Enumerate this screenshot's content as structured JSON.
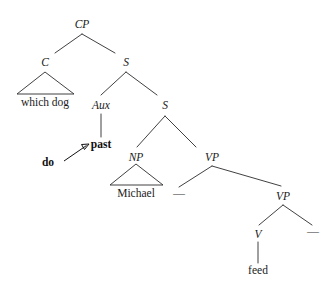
{
  "figure": {
    "kind": "syntax-tree",
    "sentence": "which dog do past Michael feed",
    "background_color": "#ffffff",
    "line_color": "#2b2b2b",
    "text_color": "#1a1a1a"
  },
  "nodes": {
    "cp": {
      "label": "CP",
      "x": 82,
      "y": 24,
      "style": "italic"
    },
    "c": {
      "label": "C",
      "x": 45,
      "y": 62,
      "style": "italic"
    },
    "s_top": {
      "label": "S",
      "x": 126,
      "y": 62,
      "style": "italic"
    },
    "aux": {
      "label": "Aux",
      "x": 101,
      "y": 105,
      "style": "italic"
    },
    "s_lower": {
      "label": "S",
      "x": 165,
      "y": 105,
      "style": "italic"
    },
    "np": {
      "label": "NP",
      "x": 136,
      "y": 157,
      "style": "italic"
    },
    "vp_upper": {
      "label": "VP",
      "x": 212,
      "y": 157,
      "style": "italic"
    },
    "vp_lower": {
      "label": "VP",
      "x": 283,
      "y": 196,
      "style": "italic"
    },
    "v": {
      "label": "V",
      "x": 258,
      "y": 234,
      "style": "italic"
    }
  },
  "terminals": {
    "which_dog": {
      "label": "which dog",
      "x": 45,
      "y": 106
    },
    "past": {
      "label": "past",
      "x": 101,
      "y": 148,
      "bold": true
    },
    "do": {
      "label": "do",
      "x": 48,
      "y": 166,
      "bold": true
    },
    "michael": {
      "label": "Michael",
      "x": 136,
      "y": 197
    },
    "feed": {
      "label": "feed",
      "x": 258,
      "y": 274
    }
  },
  "traces": {
    "trace_subject_gap": {
      "label": "—",
      "x": 179,
      "y": 196
    },
    "trace_object_gap": {
      "label": "—",
      "x": 313,
      "y": 234
    }
  },
  "triangles": {
    "c_triangle": {
      "apex_x": 45,
      "apex_y": 72,
      "left_x": 17,
      "right_x": 74,
      "base_y": 94
    },
    "np_triangle": {
      "apex_x": 136,
      "apex_y": 164,
      "left_x": 110,
      "right_x": 163,
      "base_y": 185
    }
  },
  "branches": [
    {
      "name": "cp-to-c",
      "x1": 82,
      "y1": 34,
      "x2": 55,
      "y2": 53
    },
    {
      "name": "cp-to-s",
      "x1": 82,
      "y1": 34,
      "x2": 115,
      "y2": 53
    },
    {
      "name": "s-to-aux",
      "x1": 126,
      "y1": 72,
      "x2": 101,
      "y2": 95
    },
    {
      "name": "s-to-s",
      "x1": 126,
      "y1": 72,
      "x2": 157,
      "y2": 95
    },
    {
      "name": "aux-to-past",
      "x1": 101,
      "y1": 114,
      "x2": 101,
      "y2": 137
    },
    {
      "name": "s-to-np",
      "x1": 165,
      "y1": 116,
      "x2": 137,
      "y2": 147
    },
    {
      "name": "s-to-vp",
      "x1": 165,
      "y1": 116,
      "x2": 196,
      "y2": 147
    },
    {
      "name": "vp-to-trace",
      "x1": 212,
      "y1": 166,
      "x2": 179,
      "y2": 187
    },
    {
      "name": "vp-to-vp",
      "x1": 212,
      "y1": 166,
      "x2": 281,
      "y2": 186
    },
    {
      "name": "vplower-to-v",
      "x1": 283,
      "y1": 205,
      "x2": 259,
      "y2": 225
    },
    {
      "name": "vplower-to-trace",
      "x1": 283,
      "y1": 205,
      "x2": 312,
      "y2": 225
    },
    {
      "name": "v-to-feed",
      "x1": 258,
      "y1": 242,
      "x2": 258,
      "y2": 263
    }
  ],
  "movement_arrow": {
    "name": "do-to-past-movement",
    "from_x": 64,
    "from_y": 161,
    "to_x": 88,
    "to_y": 145,
    "head_size": 4.5
  }
}
